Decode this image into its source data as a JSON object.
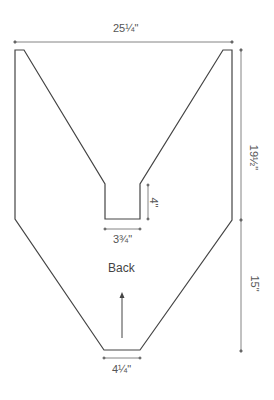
{
  "diagram": {
    "piece_label": "Back",
    "colors": {
      "outline": "#444444",
      "dimension": "#666666",
      "text": "#555555",
      "background": "#ffffff"
    },
    "dimensions": {
      "top_width": "25¼\"",
      "upper_height": "19½\"",
      "lower_height": "15\"",
      "neck_depth": "4\"",
      "neck_width": "3¾\"",
      "bottom_width": "4¼\""
    },
    "icons": {
      "grain_arrow": "up-arrow"
    }
  }
}
